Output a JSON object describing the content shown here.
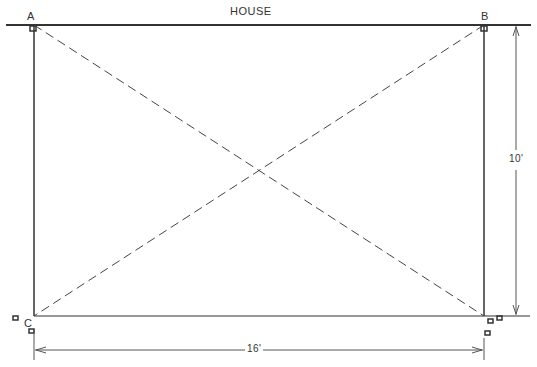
{
  "title": "HOUSE",
  "corners": {
    "a": "A",
    "b": "B",
    "c": "C",
    "d": "D"
  },
  "dimensions": {
    "width": "16'",
    "height": "10'"
  },
  "colors": {
    "line": "#333333",
    "dash": "#444444"
  }
}
